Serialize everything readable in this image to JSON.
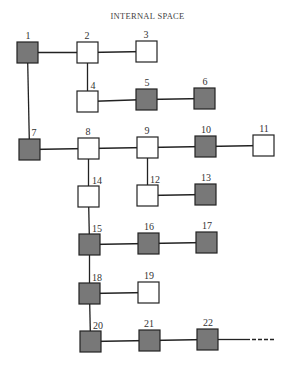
{
  "title": "INTERNAL SPACE",
  "colors": {
    "filled": "#787878",
    "empty": "#ffffff",
    "stroke": "#222222",
    "line": "#222222"
  },
  "node_size": 21,
  "nodes": [
    {
      "id": "1",
      "x": 17,
      "y": 42,
      "filled": true,
      "lx": 28,
      "ly": 39
    },
    {
      "id": "2",
      "x": 77,
      "y": 42,
      "filled": false,
      "lx": 87,
      "ly": 39
    },
    {
      "id": "3",
      "x": 136,
      "y": 41,
      "filled": false,
      "lx": 146,
      "ly": 38
    },
    {
      "id": "4",
      "x": 77,
      "y": 91,
      "filled": false,
      "lx": 93,
      "ly": 89
    },
    {
      "id": "5",
      "x": 136,
      "y": 89,
      "filled": true,
      "lx": 147,
      "ly": 86
    },
    {
      "id": "6",
      "x": 194,
      "y": 88,
      "filled": true,
      "lx": 205,
      "ly": 85
    },
    {
      "id": "7",
      "x": 19,
      "y": 139,
      "filled": true,
      "lx": 34,
      "ly": 136
    },
    {
      "id": "8",
      "x": 78,
      "y": 138,
      "filled": false,
      "lx": 88,
      "ly": 135
    },
    {
      "id": "9",
      "x": 137,
      "y": 137,
      "filled": false,
      "lx": 147,
      "ly": 134
    },
    {
      "id": "10",
      "x": 195,
      "y": 136,
      "filled": true,
      "lx": 206,
      "ly": 133
    },
    {
      "id": "11",
      "x": 253,
      "y": 135,
      "filled": false,
      "lx": 264,
      "ly": 132
    },
    {
      "id": "12",
      "x": 137,
      "y": 185,
      "filled": false,
      "lx": 155,
      "ly": 183
    },
    {
      "id": "13",
      "x": 195,
      "y": 184,
      "filled": true,
      "lx": 206,
      "ly": 181
    },
    {
      "id": "14",
      "x": 78,
      "y": 186,
      "filled": false,
      "lx": 97,
      "ly": 184
    },
    {
      "id": "15",
      "x": 79,
      "y": 234,
      "filled": true,
      "lx": 97,
      "ly": 232
    },
    {
      "id": "16",
      "x": 138,
      "y": 233,
      "filled": true,
      "lx": 149,
      "ly": 230
    },
    {
      "id": "17",
      "x": 196,
      "y": 232,
      "filled": true,
      "lx": 207,
      "ly": 229
    },
    {
      "id": "18",
      "x": 79,
      "y": 283,
      "filled": true,
      "lx": 97,
      "ly": 281
    },
    {
      "id": "19",
      "x": 138,
      "y": 282,
      "filled": false,
      "lx": 149,
      "ly": 279
    },
    {
      "id": "20",
      "x": 80,
      "y": 331,
      "filled": true,
      "lx": 98,
      "ly": 329
    },
    {
      "id": "21",
      "x": 139,
      "y": 330,
      "filled": true,
      "lx": 149,
      "ly": 327
    },
    {
      "id": "22",
      "x": 197,
      "y": 329,
      "filled": true,
      "lx": 208,
      "ly": 326
    }
  ],
  "edges": [
    [
      "1",
      "2"
    ],
    [
      "2",
      "3"
    ],
    [
      "2",
      "4"
    ],
    [
      "4",
      "5"
    ],
    [
      "5",
      "6"
    ],
    [
      "1",
      "7"
    ],
    [
      "7",
      "8"
    ],
    [
      "8",
      "9"
    ],
    [
      "9",
      "10"
    ],
    [
      "10",
      "11"
    ],
    [
      "9",
      "12"
    ],
    [
      "12",
      "13"
    ],
    [
      "8",
      "14"
    ],
    [
      "14",
      "15"
    ],
    [
      "15",
      "16"
    ],
    [
      "16",
      "17"
    ],
    [
      "15",
      "18"
    ],
    [
      "18",
      "19"
    ],
    [
      "18",
      "20"
    ],
    [
      "20",
      "21"
    ],
    [
      "21",
      "22"
    ]
  ],
  "continuation": {
    "from": "22",
    "solid_to_x": 250,
    "dashed_to_x": 275
  }
}
